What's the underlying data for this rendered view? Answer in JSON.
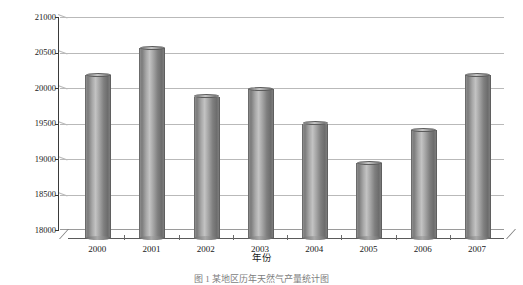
{
  "chart_data": {
    "type": "bar",
    "title": "",
    "categories": [
      "2000",
      "2001",
      "2002",
      "2003",
      "2004",
      "2005",
      "2006",
      "2007"
    ],
    "values": [
      20180,
      20560,
      19880,
      19980,
      19500,
      18940,
      19410,
      20180
    ],
    "series": [
      {
        "name": "产量",
        "values": [
          20180,
          20560,
          19880,
          19980,
          19500,
          18940,
          19410,
          20180
        ]
      }
    ],
    "xlabel": "年份",
    "ylabel": "产量，10⁴m³",
    "ylabel_base": "产量，10",
    "ylabel_exp": "4",
    "ylabel_unit": "m",
    "ylabel_unit_exp": "3",
    "ylim": [
      18000,
      21000
    ],
    "ytick_values": [
      21000,
      20500,
      20000,
      19500,
      19000,
      18500,
      18000
    ],
    "ytick_labels": [
      "21000",
      "20500",
      "20000",
      "19500",
      "19000",
      "18500",
      "18000"
    ],
    "ytick_step": 500,
    "grid": true,
    "grid_axis": "y",
    "legend": false,
    "legend_position": "none",
    "style": "3d-cylinder",
    "bar_color": "#8c8c8c"
  },
  "caption": {
    "text": "图 1  某地区历年天然气产量统计图"
  },
  "colors": {
    "background": "#ffffff",
    "axis": "#3a3a3a",
    "grid": "#b9b9b9",
    "bar": "#8c8c8c",
    "text": "#1a1a1a"
  }
}
